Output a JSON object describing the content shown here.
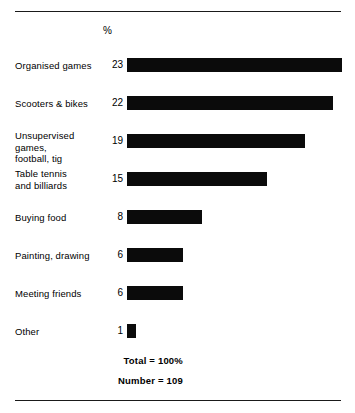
{
  "chart_data": {
    "type": "bar",
    "orientation": "horizontal",
    "title": "",
    "xlabel": "",
    "ylabel": "",
    "value_header": "%",
    "categories": [
      "Organised games",
      "Scooters & bikes",
      "Unsupervised games,\nfootball, tig",
      "Table tennis\nand billiards",
      "Buying food",
      "Painting, drawing",
      "Meeting friends",
      "Other"
    ],
    "values": [
      23,
      22,
      19,
      15,
      8,
      6,
      6,
      1
    ],
    "xlim": [
      0,
      23
    ],
    "grid": false,
    "legend": false,
    "bar_color": "#0b0b0b",
    "annotations": [
      "Total = 100%",
      "Number = 109"
    ]
  },
  "footer": {
    "total_label": "Total = 100%",
    "number_label": "Number = 109"
  }
}
